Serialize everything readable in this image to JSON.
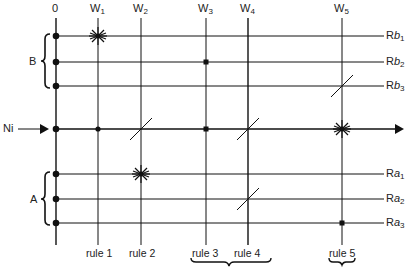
{
  "diagram": {
    "columns": [
      {
        "id": "col-0",
        "label": "0",
        "sub": "",
        "x": 56
      },
      {
        "id": "col-w1",
        "label": "W",
        "sub": "1",
        "x": 98
      },
      {
        "id": "col-w2",
        "label": "W",
        "sub": "2",
        "x": 141
      },
      {
        "id": "col-w3",
        "label": "W",
        "sub": "3",
        "x": 206
      },
      {
        "id": "col-w4",
        "label": "W",
        "sub": "4",
        "x": 248
      },
      {
        "id": "col-w5",
        "label": "W",
        "sub": "5",
        "x": 342
      }
    ],
    "rows": [
      {
        "id": "row-rb1",
        "label": "Rb",
        "sub": "1",
        "y": 36
      },
      {
        "id": "row-rb2",
        "label": "Rb",
        "sub": "2",
        "y": 62
      },
      {
        "id": "row-rb3",
        "label": "Rb",
        "sub": "3",
        "y": 86
      },
      {
        "id": "row-ni",
        "label": "Ni",
        "y": 129
      },
      {
        "id": "row-ra1",
        "label": "Ra",
        "sub": "1",
        "y": 174
      },
      {
        "id": "row-ra2",
        "label": "Ra",
        "sub": "2",
        "y": 199
      },
      {
        "id": "row-ra3",
        "label": "Ra",
        "sub": "3",
        "y": 223
      }
    ],
    "groups": [
      {
        "label": "B",
        "rows": [
          "Rb1",
          "Rb2",
          "Rb3"
        ]
      },
      {
        "label": "A",
        "rows": [
          "Ra1",
          "Ra2",
          "Ra3"
        ]
      }
    ],
    "input_label": "Ni",
    "rules": [
      {
        "label": "rule 1",
        "column": "W1"
      },
      {
        "label": "rule 2",
        "column": "W2"
      },
      {
        "label": "rule 3",
        "column": "W3"
      },
      {
        "label": "rule 4",
        "column": "W4"
      },
      {
        "label": "rule 5",
        "column": "W5"
      }
    ],
    "bracketed_rule_groups": [
      [
        "rule 3",
        "rule 4"
      ],
      [
        "rule 5"
      ]
    ],
    "markers": [
      {
        "type": "star",
        "column": "W1",
        "row": "Rb1"
      },
      {
        "type": "dot",
        "column": "W3",
        "row": "Rb2"
      },
      {
        "type": "slash",
        "column": "W5",
        "row": "Rb3"
      },
      {
        "type": "dot",
        "column": "W1",
        "row": "Ni"
      },
      {
        "type": "slash",
        "column": "W2",
        "row": "Ni"
      },
      {
        "type": "dot",
        "column": "W3",
        "row": "Ni"
      },
      {
        "type": "slash",
        "column": "W4",
        "row": "Ni"
      },
      {
        "type": "star",
        "column": "W5",
        "row": "Ni"
      },
      {
        "type": "star",
        "column": "W2",
        "row": "Ra1"
      },
      {
        "type": "slash",
        "column": "W4",
        "row": "Ra2"
      },
      {
        "type": "dot",
        "column": "W5",
        "row": "Ra3"
      }
    ]
  }
}
